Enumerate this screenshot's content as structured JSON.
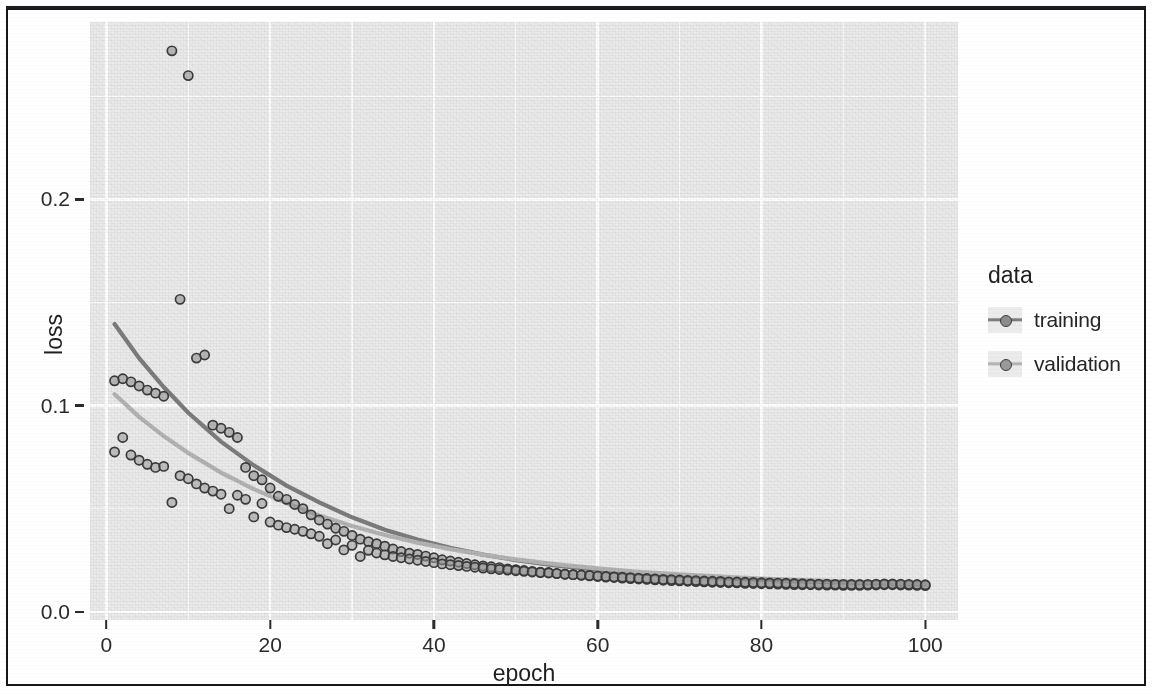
{
  "figure": {
    "background_color": "#ffffff",
    "panel_color": "#ebebeb",
    "grid_color": "#ffffff",
    "frame_color": "#15161a"
  },
  "axes": {
    "x_title": "epoch",
    "y_title": "loss",
    "x_ticks": [
      "0",
      "20",
      "40",
      "60",
      "80",
      "100"
    ],
    "y_ticks": [
      "0.0",
      "0.1",
      "0.2"
    ]
  },
  "legend": {
    "title": "data",
    "items": [
      {
        "label": "training",
        "color": "#7d7d7d",
        "point_fill": "#8d8d8d",
        "point_stroke": "#3b3b3b"
      },
      {
        "label": "validation",
        "color": "#b4b4b4",
        "point_fill": "#9a9a9a",
        "point_stroke": "#3b3b3b"
      }
    ]
  },
  "chart_data": {
    "type": "scatter",
    "title": "",
    "xlabel": "epoch",
    "ylabel": "loss",
    "xlim": [
      -2,
      104
    ],
    "ylim": [
      -0.004,
      0.286
    ],
    "grid": true,
    "legend_position": "right",
    "legend_title": "data",
    "x_ticks": [
      0,
      20,
      40,
      60,
      80,
      100
    ],
    "y_ticks": [
      0.0,
      0.1,
      0.2
    ],
    "x_minor_ticks": [
      10,
      30,
      50,
      70,
      90
    ],
    "y_minor_ticks": [
      0.05,
      0.15,
      0.25
    ],
    "marker": "circle-outline",
    "smoother": "loess",
    "series": [
      {
        "name": "training",
        "color": "#7d7d7d",
        "x": [
          1,
          2,
          3,
          4,
          5,
          6,
          7,
          8,
          9,
          10,
          11,
          12,
          13,
          14,
          15,
          16,
          17,
          18,
          19,
          20,
          21,
          22,
          23,
          24,
          25,
          26,
          27,
          28,
          29,
          30,
          31,
          32,
          33,
          34,
          35,
          36,
          37,
          38,
          39,
          40,
          41,
          42,
          43,
          44,
          45,
          46,
          47,
          48,
          49,
          50,
          51,
          52,
          53,
          54,
          55,
          56,
          57,
          58,
          59,
          60,
          61,
          62,
          63,
          64,
          65,
          66,
          67,
          68,
          69,
          70,
          71,
          72,
          73,
          74,
          75,
          76,
          77,
          78,
          79,
          80,
          81,
          82,
          83,
          84,
          85,
          86,
          87,
          88,
          89,
          90,
          91,
          92,
          93,
          94,
          95,
          96,
          97,
          98,
          99,
          100
        ],
        "y": [
          0.112,
          0.113,
          0.1115,
          0.1095,
          0.1075,
          0.106,
          0.1045,
          0.272,
          0.1515,
          0.26,
          0.123,
          0.1245,
          0.0905,
          0.089,
          0.087,
          0.0845,
          0.07,
          0.066,
          0.064,
          0.06,
          0.056,
          0.0545,
          0.052,
          0.05,
          0.047,
          0.0445,
          0.0425,
          0.0405,
          0.039,
          0.037,
          0.0352,
          0.034,
          0.033,
          0.0318,
          0.0304,
          0.0292,
          0.0284,
          0.0278,
          0.027,
          0.0262,
          0.0252,
          0.0246,
          0.024,
          0.0234,
          0.0228,
          0.0222,
          0.0218,
          0.0214,
          0.0208,
          0.0204,
          0.02,
          0.0196,
          0.0192,
          0.019,
          0.0186,
          0.0182,
          0.018,
          0.0177,
          0.0174,
          0.0171,
          0.0168,
          0.0166,
          0.0163,
          0.0161,
          0.0159,
          0.0157,
          0.0155,
          0.0153,
          0.0151,
          0.015,
          0.0148,
          0.0146,
          0.0145,
          0.0143,
          0.0142,
          0.0141,
          0.014,
          0.0138,
          0.0137,
          0.0136,
          0.0135,
          0.0134,
          0.0133,
          0.0132,
          0.0131,
          0.0131,
          0.013,
          0.0129,
          0.0129,
          0.0128,
          0.0128,
          0.0128,
          0.0129,
          0.013,
          0.0131,
          0.0131,
          0.013,
          0.0129,
          0.0128,
          0.0127
        ]
      },
      {
        "name": "validation",
        "color": "#b4b4b4",
        "x": [
          1,
          2,
          3,
          4,
          5,
          6,
          7,
          8,
          9,
          10,
          11,
          12,
          13,
          14,
          15,
          16,
          17,
          18,
          19,
          20,
          21,
          22,
          23,
          24,
          25,
          26,
          27,
          28,
          29,
          30,
          31,
          32,
          33,
          34,
          35,
          36,
          37,
          38,
          39,
          40,
          41,
          42,
          43,
          44,
          45,
          46,
          47,
          48,
          49,
          50,
          51,
          52,
          53,
          54,
          55,
          56,
          57,
          58,
          59,
          60,
          61,
          62,
          63,
          64,
          65,
          66,
          67,
          68,
          69,
          70,
          71,
          72,
          73,
          74,
          75,
          76,
          77,
          78,
          79,
          80,
          81,
          82,
          83,
          84,
          85,
          86,
          87,
          88,
          89,
          90,
          91,
          92,
          93,
          94,
          95,
          96,
          97,
          98,
          99,
          100
        ],
        "y": [
          0.0775,
          0.0845,
          0.076,
          0.0735,
          0.0715,
          0.07,
          0.0705,
          0.053,
          0.066,
          0.0645,
          0.062,
          0.06,
          0.0585,
          0.057,
          0.05,
          0.0565,
          0.0545,
          0.046,
          0.0525,
          0.0435,
          0.042,
          0.0408,
          0.04,
          0.039,
          0.0378,
          0.0366,
          0.033,
          0.0348,
          0.03,
          0.0322,
          0.0268,
          0.0298,
          0.0285,
          0.0276,
          0.0268,
          0.0262,
          0.0256,
          0.025,
          0.0244,
          0.0238,
          0.0232,
          0.0228,
          0.0224,
          0.022,
          0.0216,
          0.0212,
          0.0208,
          0.0205,
          0.0202,
          0.0199,
          0.0196,
          0.0193,
          0.019,
          0.0188,
          0.0185,
          0.0182,
          0.018,
          0.0178,
          0.0176,
          0.0173,
          0.0171,
          0.0169,
          0.0167,
          0.0165,
          0.0163,
          0.0161,
          0.0159,
          0.0157,
          0.0156,
          0.0154,
          0.0152,
          0.0151,
          0.0149,
          0.0148,
          0.0147,
          0.0145,
          0.0144,
          0.0143,
          0.0142,
          0.0141,
          0.014,
          0.0139,
          0.0138,
          0.0137,
          0.0136,
          0.0135,
          0.0134,
          0.0134,
          0.0133,
          0.0133,
          0.0132,
          0.0132,
          0.0133,
          0.0134,
          0.0135,
          0.0135,
          0.0134,
          0.0133,
          0.0132,
          0.0131
        ]
      }
    ],
    "trend_lines": [
      {
        "name": "training",
        "color": "#7d7d7d",
        "x": [
          1,
          4,
          7,
          10,
          14,
          18,
          22,
          26,
          30,
          34,
          38,
          42,
          46,
          50,
          55,
          60,
          65,
          70,
          75,
          80,
          85,
          90,
          95,
          100
        ],
        "y": [
          0.1395,
          0.123,
          0.109,
          0.0965,
          0.0825,
          0.071,
          0.0612,
          0.053,
          0.0458,
          0.0398,
          0.035,
          0.031,
          0.0277,
          0.025,
          0.0224,
          0.0203,
          0.0187,
          0.0174,
          0.0163,
          0.0154,
          0.0147,
          0.0141,
          0.0136,
          0.0132
        ]
      },
      {
        "name": "validation",
        "color": "#b4b4b4",
        "x": [
          1,
          4,
          7,
          10,
          14,
          18,
          22,
          26,
          30,
          34,
          38,
          42,
          46,
          50,
          55,
          60,
          65,
          70,
          75,
          80,
          85,
          90,
          95,
          100
        ],
        "y": [
          0.1055,
          0.0945,
          0.0852,
          0.077,
          0.0675,
          0.0595,
          0.0527,
          0.0467,
          0.0416,
          0.0372,
          0.0335,
          0.0304,
          0.0277,
          0.0254,
          0.023,
          0.021,
          0.0194,
          0.0181,
          0.017,
          0.0161,
          0.0153,
          0.0147,
          0.0141,
          0.0137
        ]
      }
    ]
  }
}
